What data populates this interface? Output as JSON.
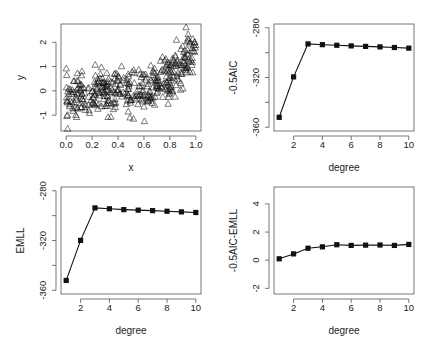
{
  "figure": {
    "background": "#ffffff",
    "ink_color": "#111111",
    "panel_count": 4
  },
  "chart_data": [
    {
      "id": "scatter",
      "type": "scatter",
      "title": "",
      "xlabel": "x",
      "ylabel": "y",
      "xlim": [
        -0.04,
        1.04
      ],
      "ylim": [
        -1.65,
        2.75
      ],
      "xticks": [
        0.0,
        0.2,
        0.4,
        0.6,
        0.8,
        1.0
      ],
      "xtick_labels": [
        "0.0",
        "0.2",
        "0.4",
        "0.6",
        "0.8",
        "1.0"
      ],
      "yticks": [
        -1,
        0,
        1,
        2
      ],
      "ytick_labels": [
        "-1",
        "0",
        "1",
        "2"
      ],
      "marker": "open-triangle",
      "n_points": 400,
      "generating_trend": {
        "description": "y increases with x; flat near 0 for x<0.6, rising steeply to ~2 at x=1",
        "x": [
          0.0,
          0.1,
          0.2,
          0.3,
          0.4,
          0.5,
          0.6,
          0.7,
          0.8,
          0.9,
          1.0
        ],
        "y_mean": [
          -0.3,
          -0.25,
          -0.15,
          0.0,
          0.05,
          0.0,
          0.05,
          0.3,
          0.6,
          1.1,
          2.0
        ],
        "y_spread": 0.45
      },
      "grid": false,
      "legend": null
    },
    {
      "id": "aic",
      "type": "line",
      "title": "",
      "xlabel": "degree",
      "ylabel": "-0.5AIC",
      "xlim": [
        0.64,
        10.36
      ],
      "ylim": [
        -363,
        -277
      ],
      "xticks": [
        2,
        4,
        6,
        8,
        10
      ],
      "xtick_labels": [
        "2",
        "4",
        "6",
        "8",
        "10"
      ],
      "yticks": [
        -360,
        -340,
        -320,
        -300,
        -280
      ],
      "ytick_labels": [
        "-360",
        "",
        "-320",
        "",
        "-280"
      ],
      "x": [
        1,
        2,
        3,
        4,
        5,
        6,
        7,
        8,
        9,
        10
      ],
      "values": [
        -352.0,
        -319.5,
        -293.0,
        -293.6,
        -294.1,
        -294.6,
        -295.0,
        -295.4,
        -295.9,
        -296.4
      ],
      "marker": "filled-square",
      "grid": false,
      "legend": null
    },
    {
      "id": "emll",
      "type": "line",
      "title": "",
      "xlabel": "degree",
      "ylabel": "EMLL",
      "xlim": [
        0.64,
        10.36
      ],
      "ylim": [
        -363,
        -277
      ],
      "xticks": [
        2,
        4,
        6,
        8,
        10
      ],
      "xtick_labels": [
        "2",
        "4",
        "6",
        "8",
        "10"
      ],
      "yticks": [
        -360,
        -340,
        -320,
        -300,
        -280
      ],
      "ytick_labels": [
        "-360",
        "",
        "-320",
        "",
        "-280"
      ],
      "x": [
        1,
        2,
        3,
        4,
        5,
        6,
        7,
        8,
        9,
        10
      ],
      "values": [
        -352.1,
        -319.9,
        -293.8,
        -294.5,
        -295.2,
        -295.6,
        -296.0,
        -296.5,
        -297.0,
        -297.5
      ],
      "marker": "filled-square",
      "grid": false,
      "legend": null
    },
    {
      "id": "diff",
      "type": "line",
      "title": "",
      "xlabel": "degree",
      "ylabel": "-0.5AIC-EMLL",
      "xlim": [
        0.64,
        10.36
      ],
      "ylim": [
        -2.4,
        5.2
      ],
      "xticks": [
        2,
        4,
        6,
        8,
        10
      ],
      "xtick_labels": [
        "2",
        "4",
        "6",
        "8",
        "10"
      ],
      "yticks": [
        -2,
        0,
        2,
        4
      ],
      "ytick_labels": [
        "-2",
        "0",
        "2",
        "4"
      ],
      "x": [
        1,
        2,
        3,
        4,
        5,
        6,
        7,
        8,
        9,
        10
      ],
      "values": [
        0.1,
        0.45,
        0.85,
        0.95,
        1.1,
        1.05,
        1.07,
        1.08,
        1.05,
        1.12
      ],
      "marker": "filled-square",
      "grid": false,
      "legend": null
    }
  ],
  "panels": [
    {
      "chart": 0,
      "frame": {
        "x": 61,
        "y": 24,
        "w": 140,
        "h": 107
      },
      "xlabel_y": 171,
      "ylabel_x": 24,
      "tick_label_y": 148,
      "ytick_label_x": 46
    },
    {
      "chart": 1,
      "frame": {
        "x": 274,
        "y": 24,
        "w": 140,
        "h": 107
      },
      "xlabel_y": 171,
      "ylabel_x": 237,
      "tick_label_y": 148,
      "ytick_label_x": 259
    },
    {
      "chart": 2,
      "frame": {
        "x": 61,
        "y": 187,
        "w": 140,
        "h": 107
      },
      "xlabel_y": 334,
      "ylabel_x": 24,
      "tick_label_y": 311,
      "ytick_label_x": 46
    },
    {
      "chart": 3,
      "frame": {
        "x": 274,
        "y": 187,
        "w": 140,
        "h": 107
      },
      "xlabel_y": 334,
      "ylabel_x": 237,
      "tick_label_y": 311,
      "ytick_label_x": 259
    }
  ]
}
